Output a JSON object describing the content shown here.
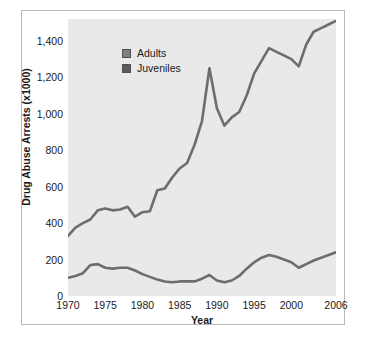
{
  "chart_data": {
    "type": "line",
    "title": "",
    "xlabel": "Year",
    "ylabel": "Drug Abuse Arrests (x1000)",
    "xlim": [
      1970,
      2006
    ],
    "ylim": [
      0,
      1520
    ],
    "grid": false,
    "legend_position": "upper-left-inside",
    "plot_background": "#e9e9e9",
    "line_color": "#6d6d6d",
    "axis_color": "#2a2a2a",
    "frame_color": "#b9b9b9",
    "xticks": [
      "1970",
      "1975",
      "1980",
      "1985",
      "1990",
      "1995",
      "2000",
      "2006"
    ],
    "xtick_values": [
      1970,
      1975,
      1980,
      1985,
      1990,
      1995,
      2000,
      2006
    ],
    "yticks": [
      "0",
      "200",
      "400",
      "600",
      "800",
      "1,000",
      "1,200",
      "1,400"
    ],
    "ytick_values": [
      0,
      200,
      400,
      600,
      800,
      1000,
      1200,
      1400
    ],
    "x": [
      1970,
      1971,
      1972,
      1973,
      1974,
      1975,
      1976,
      1977,
      1978,
      1979,
      1980,
      1981,
      1982,
      1983,
      1984,
      1985,
      1986,
      1987,
      1988,
      1989,
      1990,
      1991,
      1992,
      1993,
      1994,
      1995,
      1996,
      1997,
      1998,
      1999,
      2000,
      2001,
      2002,
      2003,
      2004,
      2005,
      2006
    ],
    "series": [
      {
        "name": "Adults",
        "color": "#6d6d6d",
        "values": [
          330,
          375,
          400,
          420,
          470,
          480,
          470,
          475,
          490,
          435,
          460,
          465,
          580,
          590,
          650,
          700,
          730,
          830,
          960,
          1250,
          1030,
          935,
          980,
          1010,
          1100,
          1220,
          1290,
          1360,
          1340,
          1320,
          1300,
          1260,
          1380,
          1450,
          1470,
          1490,
          1510
        ]
      },
      {
        "name": "Juveniles",
        "color": "#6d6d6d",
        "values": [
          100,
          110,
          125,
          170,
          175,
          155,
          150,
          155,
          155,
          140,
          120,
          105,
          90,
          80,
          75,
          80,
          80,
          80,
          95,
          115,
          85,
          75,
          85,
          110,
          150,
          185,
          210,
          225,
          215,
          200,
          185,
          155,
          175,
          195,
          210,
          225,
          240
        ]
      }
    ]
  },
  "legend": {
    "items": [
      {
        "label": "Adults",
        "color": "#808080"
      },
      {
        "label": "Juveniles",
        "color": "#5c5c5c"
      }
    ]
  }
}
